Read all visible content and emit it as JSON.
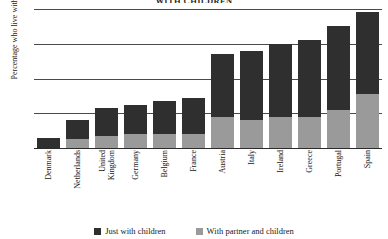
{
  "chart_data": {
    "type": "bar",
    "stacked": true,
    "title": "WITH CHILDREN",
    "xlabel": "",
    "ylabel": "Percentage who live with their children",
    "ylim": [
      0,
      40
    ],
    "yticks": [
      0,
      10,
      20,
      30,
      40
    ],
    "grid": true,
    "legend_position": "bottom",
    "categories": [
      "Denmark",
      "Netherlands",
      "United Kingdom",
      "Germany",
      "Belgium",
      "France",
      "Austria",
      "Italy",
      "Ireland",
      "Greece",
      "Portugal",
      "Spain"
    ],
    "series": [
      {
        "name": "Just with children",
        "color": "#2f2f2f",
        "values": [
          3.0,
          5.5,
          8.0,
          8.5,
          9.5,
          10.5,
          18.0,
          20.0,
          21.0,
          22.0,
          24.0,
          23.5
        ]
      },
      {
        "name": "With partner and children",
        "color": "#9a9a9a",
        "values": [
          0.0,
          2.5,
          3.5,
          4.0,
          4.0,
          4.0,
          9.0,
          8.0,
          9.0,
          9.0,
          11.0,
          15.5
        ]
      }
    ],
    "totals": [
      3.0,
      8.0,
      11.5,
      12.5,
      13.5,
      14.5,
      27.0,
      28.0,
      30.0,
      31.0,
      35.0,
      39.0
    ]
  },
  "legend": {
    "items": [
      {
        "label": "Just with children",
        "color": "#2f2f2f"
      },
      {
        "label": "With partner and children",
        "color": "#9a9a9a"
      }
    ]
  },
  "axis": {
    "y_tick_labels": [
      "40",
      "30",
      "20",
      "10",
      "0"
    ]
  }
}
